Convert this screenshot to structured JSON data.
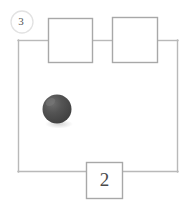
{
  "figure": {
    "background_color": "#ffffff",
    "width": 194,
    "height": 207,
    "wire_color": "#b9b9b9",
    "box_border_color": "#a8a8a8",
    "corner_label": {
      "text": "3",
      "shape": "circle-outline",
      "cx": 22,
      "cy": 22,
      "r": 11,
      "color": "#555555"
    },
    "loop": {
      "x": 18,
      "y": 40,
      "width": 160,
      "height": 132
    },
    "components": [
      {
        "id": "component-box-left",
        "label": "",
        "x": 48,
        "y": 18,
        "width": 44,
        "height": 44
      },
      {
        "id": "component-box-right",
        "label": "",
        "x": 112,
        "y": 17,
        "width": 45,
        "height": 45
      },
      {
        "id": "component-box-bottom",
        "label": "2",
        "x": 86,
        "y": 162,
        "width": 36,
        "height": 36
      }
    ],
    "ball": {
      "id": "ball-object",
      "cx": 57,
      "cy": 109,
      "r": 14.5,
      "fill": "#4a4a4a",
      "highlight_color": "#6e6e6e",
      "shadow_color": "#d9d9d9"
    }
  }
}
